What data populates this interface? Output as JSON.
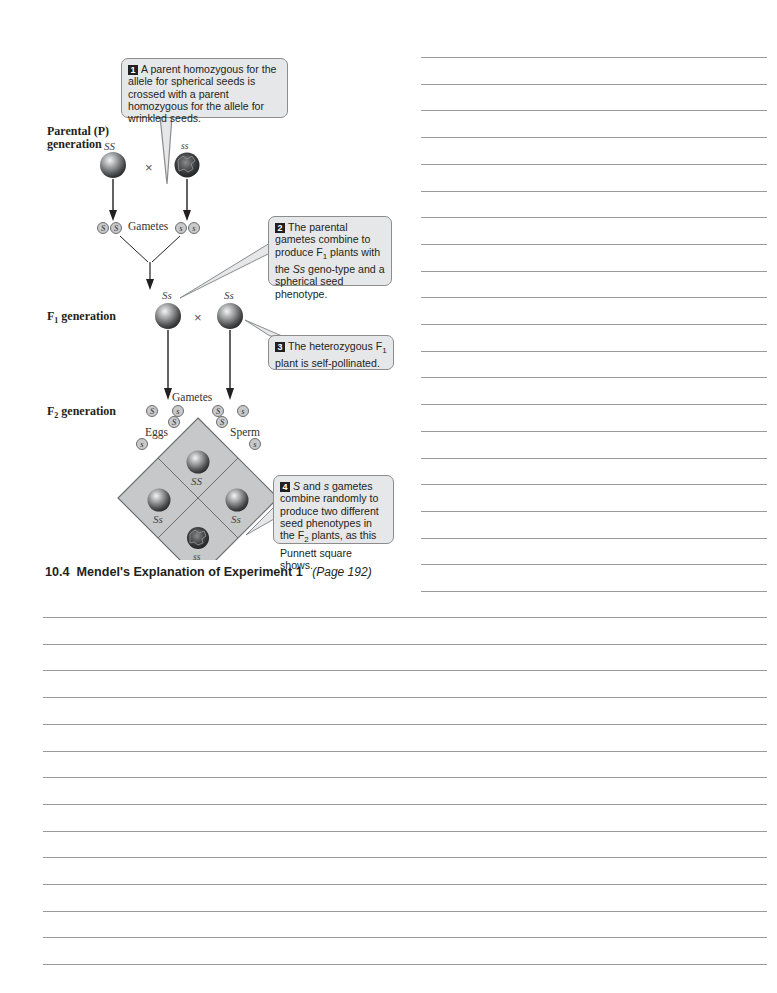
{
  "page": {
    "section_heading": {
      "number": "10.4",
      "title": "Mendel's Explanation of Experiment 1",
      "page_ref": "(Page 192)"
    }
  },
  "figure": {
    "generation_labels": {
      "parental_line1": "Parental (P)",
      "parental_line2": "generation",
      "f1": "F",
      "f1_sub": "1",
      "f1_rest": " generation",
      "f2": "F",
      "f2_sub": "2",
      "f2_rest": " generation"
    },
    "parental": {
      "left_genotype": "SS",
      "right_genotype": "ss",
      "cross_symbol": "×",
      "gametes_label": "Gametes",
      "left_gametes": [
        "S",
        "S"
      ],
      "right_gametes": [
        "s",
        "s"
      ]
    },
    "f1": {
      "left_genotype": "Ss",
      "right_genotype": "Ss",
      "cross_symbol": "×",
      "gametes_label": "Gametes",
      "gametes": [
        "S",
        "s",
        "S",
        "s"
      ]
    },
    "punnett": {
      "eggs_label": "Eggs",
      "sperm_label": "Sperm",
      "egg_alleles": [
        "S",
        "s"
      ],
      "sperm_alleles": [
        "S",
        "s"
      ],
      "cells": {
        "top": "SS",
        "left": "Ss",
        "right": "Ss",
        "bottom": "ss"
      }
    },
    "callouts": [
      {
        "num": "1",
        "text": "A parent homozygous for the allele for spherical seeds is crossed with a parent homozygous for the allele for wrinkled seeds."
      },
      {
        "num": "2",
        "text_a": "The parental gametes combine to produce F",
        "sub": "1",
        "text_b": " plants with the ",
        "italic": "Ss",
        "text_c": " geno-type and a spherical seed phenotype."
      },
      {
        "num": "3",
        "text_a": "The heterozygous F",
        "sub": "1",
        "text_b": " plant is self-pollinated."
      },
      {
        "num": "4",
        "italic_a": "S",
        "text_a": " and ",
        "italic_b": "s",
        "text_b": " gametes combine randomly to produce two different seed phenotypes in the F",
        "sub": "2",
        "text_c": " plants, as this Punnett square shows."
      }
    ]
  },
  "colors": {
    "callout_bg": "#e6e7e8",
    "callout_border": "#8a8c8e",
    "punnett_fill": "#c7c8c9",
    "rule_line": "#9a9a9a",
    "text": "#231f20"
  }
}
